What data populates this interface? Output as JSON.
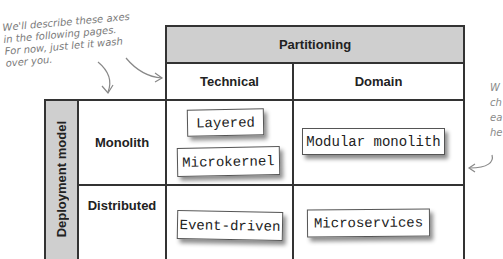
{
  "annotations": {
    "left_note": [
      "We'll describe these axes",
      "in the following pages.",
      "For now, just let it wash",
      "over you."
    ],
    "right_note": [
      "W",
      "ch",
      "ea",
      "he"
    ]
  },
  "partitioning": {
    "title": "Partitioning",
    "columns": [
      "Technical",
      "Domain"
    ]
  },
  "deployment": {
    "title": "Deployment model",
    "rows": [
      "Monolith",
      "Distributed"
    ]
  },
  "cells": {
    "monolith_technical": [
      "Layered",
      "Microkernel"
    ],
    "monolith_domain": [
      "Modular monolith"
    ],
    "distributed_technical": [
      "Event-driven"
    ],
    "distributed_domain": [
      "Microservices"
    ]
  },
  "colors": {
    "header_gray": "#cfcfcf",
    "grid_line": "#333333",
    "annotation": "#7a7a7a"
  }
}
